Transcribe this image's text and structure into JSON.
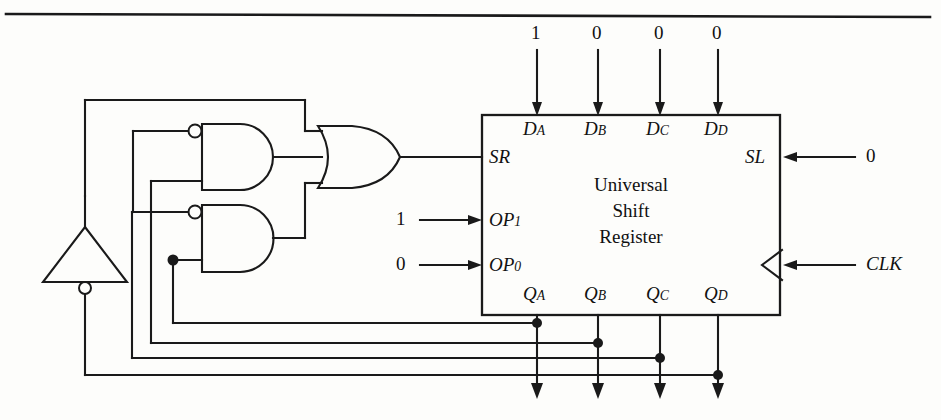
{
  "figure": {
    "title_rule": true,
    "block": {
      "name_lines": [
        "Universal",
        "Shift",
        "Register"
      ]
    },
    "data_inputs": [
      {
        "label": "D",
        "sub": "A",
        "value": "1",
        "x": 537
      },
      {
        "label": "D",
        "sub": "B",
        "value": "0",
        "x": 598
      },
      {
        "label": "D",
        "sub": "C",
        "value": "0",
        "x": 660
      },
      {
        "label": "D",
        "sub": "D",
        "value": "0",
        "x": 718
      }
    ],
    "outputs": [
      {
        "label": "Q",
        "sub": "A",
        "x": 537
      },
      {
        "label": "Q",
        "sub": "B",
        "x": 598
      },
      {
        "label": "Q",
        "sub": "C",
        "x": 660
      },
      {
        "label": "Q",
        "sub": "D",
        "x": 718
      }
    ],
    "left_ports": [
      {
        "label": "SR",
        "sub": "",
        "value": "",
        "y": 157
      },
      {
        "label": "OP",
        "sub": "1",
        "value": "1",
        "y": 220
      },
      {
        "label": "OP",
        "sub": "0",
        "value": "0",
        "y": 265
      }
    ],
    "right_ports": [
      {
        "label": "SL",
        "sub": "",
        "value": "0",
        "y": 157
      },
      {
        "label": "CLK",
        "sub": "",
        "value": "",
        "y": 265
      }
    ],
    "gates": [
      {
        "kind": "and-gate-inverted-input",
        "name": "and-gate-top"
      },
      {
        "kind": "and-gate-inverted-input",
        "name": "and-gate-bottom"
      },
      {
        "kind": "or-gate",
        "name": "or-gate"
      },
      {
        "kind": "inverter",
        "name": "inverter"
      }
    ],
    "colors": {
      "line": "#1a1a1a",
      "background": "#fdfdfb",
      "text": "#111111"
    }
  }
}
